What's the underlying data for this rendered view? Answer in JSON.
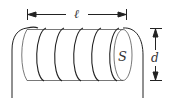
{
  "diagram": {
    "labels": {
      "length": "ℓ",
      "area": "S",
      "diameter": "d"
    },
    "turns": 6,
    "colors": {
      "stroke": "#222222",
      "background": "#ffffff"
    }
  }
}
